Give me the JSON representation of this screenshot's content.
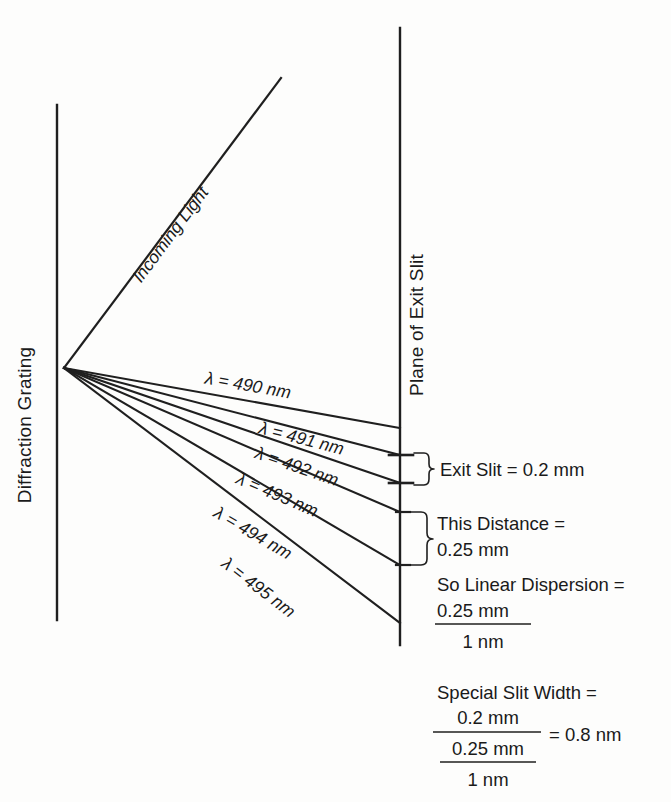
{
  "figure": {
    "background_color": "#fdfdfc",
    "line_color": "#1f1f1f"
  },
  "labels": {
    "grating": "Diffraction Grating",
    "exit_plane": "Plane of Exit Slit",
    "incoming": "Incoming Light"
  },
  "rays": [
    {
      "id": "ray-490",
      "label": "λ = 490 nm",
      "wavelength_nm": 490,
      "end_y": 428
    },
    {
      "id": "ray-491",
      "label": "λ = 491 nm",
      "wavelength_nm": 491,
      "end_y": 455
    },
    {
      "id": "ray-492",
      "label": "λ = 492 nm",
      "wavelength_nm": 492,
      "end_y": 483
    },
    {
      "id": "ray-493",
      "label": "λ = 493 nm",
      "wavelength_nm": 493,
      "end_y": 512
    },
    {
      "id": "ray-494",
      "label": "λ = 494 nm",
      "wavelength_nm": 494,
      "end_y": 565
    },
    {
      "id": "ray-495",
      "label": "λ = 495 nm",
      "wavelength_nm": 495,
      "end_y": 623
    }
  ],
  "annotations": {
    "exit_slit": "Exit Slit = 0.2 mm",
    "this_distance_line1": "This Distance =",
    "this_distance_line2": "0.25 mm",
    "linear_dispersion_heading": "So Linear Dispersion =",
    "linear_dispersion_numerator": "0.25 mm",
    "linear_dispersion_denominator": "1 nm",
    "special_slit_heading": "Special Slit Width =",
    "special_slit_numerator": "0.2 mm",
    "special_slit_sub_numerator": "0.25 mm",
    "special_slit_sub_denominator": "1 nm",
    "special_slit_result": "= 0.8 nm"
  }
}
